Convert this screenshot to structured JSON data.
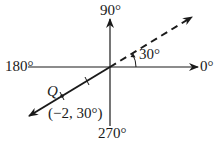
{
  "diagram": {
    "type": "polar-coordinate-axes",
    "axis_labels": {
      "right": "0°",
      "top": "90°",
      "left": "180°",
      "bottom": "270°"
    },
    "angle_label": "30°",
    "point_label": "Q",
    "point_coordinates": "(−2, 30°)",
    "ray_angle_degrees": 30,
    "point_r": -2,
    "colors": {
      "stroke": "#1a1a1a",
      "background": "#ffffff"
    }
  }
}
